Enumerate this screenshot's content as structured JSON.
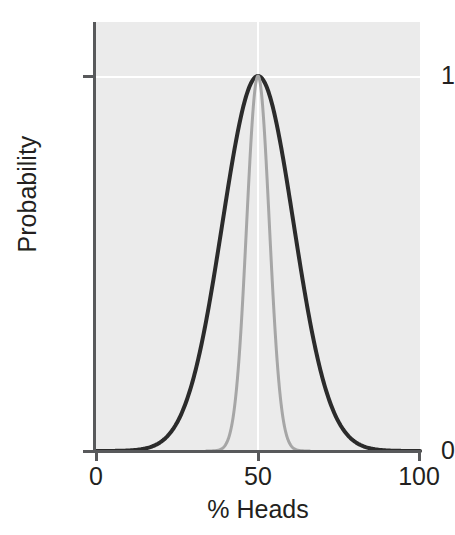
{
  "figure": {
    "background_color": "#ffffff",
    "panel_color": "#ebebeb",
    "gridline_color": "#ffffff",
    "axis_color": "#58595b",
    "text_color": "#231f20"
  },
  "axes": {
    "x_title": "% Heads",
    "y_title": "Probability",
    "x_ticks": [
      {
        "value": 0,
        "label": "0"
      },
      {
        "value": 50,
        "label": "50"
      },
      {
        "value": 100,
        "label": "100"
      }
    ],
    "y_ticks": [
      {
        "value": 0,
        "label": "0"
      },
      {
        "value": 1,
        "label": "1"
      }
    ]
  },
  "chart_data": {
    "type": "line",
    "title": "",
    "subtitle": "",
    "xlabel": "% Heads",
    "ylabel": "Probability",
    "xlim": [
      0,
      100
    ],
    "ylim": [
      0,
      1
    ],
    "xticks": [
      0,
      50,
      100
    ],
    "yticks": [
      0,
      1
    ],
    "grid": true,
    "grid_lines": {
      "horizontal_at": [
        1
      ],
      "vertical_at": [
        50
      ]
    },
    "legend": null,
    "annotations": [],
    "series": [
      {
        "name": "wide-distribution",
        "color": "#2b2b2b",
        "line_width": 4,
        "mean": 50,
        "sigma": 11,
        "peak_value": 1,
        "x": [
          0,
          5,
          10,
          15,
          20,
          25,
          28,
          30,
          32,
          34,
          36,
          38,
          40,
          42,
          44,
          46,
          48,
          50,
          52,
          54,
          56,
          58,
          60,
          62,
          64,
          66,
          68,
          70,
          72,
          75,
          80,
          85,
          90,
          95,
          100
        ],
        "values": [
          0.0,
          0.003,
          0.013,
          0.046,
          0.13,
          0.29,
          0.41,
          0.49,
          0.58,
          0.66,
          0.74,
          0.81,
          0.87,
          0.93,
          0.97,
          0.99,
          1.0,
          1.0,
          1.0,
          0.99,
          0.97,
          0.93,
          0.87,
          0.81,
          0.74,
          0.66,
          0.58,
          0.49,
          0.41,
          0.29,
          0.13,
          0.046,
          0.013,
          0.003,
          0.0
        ]
      },
      {
        "name": "narrow-distribution",
        "color": "#a6a6a6",
        "line_width": 3,
        "mean": 50,
        "sigma": 3.5,
        "peak_value": 1,
        "x": [
          34,
          36,
          38,
          40,
          42,
          44,
          45,
          46,
          47,
          48,
          49,
          50,
          51,
          52,
          53,
          54,
          55,
          56,
          58,
          60,
          62,
          64,
          66
        ],
        "values": [
          0.0,
          0.0003,
          0.003,
          0.021,
          0.099,
          0.32,
          0.49,
          0.66,
          0.82,
          0.93,
          0.99,
          1.0,
          0.99,
          0.93,
          0.82,
          0.66,
          0.49,
          0.32,
          0.099,
          0.021,
          0.003,
          0.0003,
          0.0
        ]
      }
    ]
  }
}
